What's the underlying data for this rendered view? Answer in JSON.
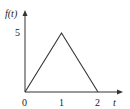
{
  "chart_data": {
    "type": "line",
    "title": "",
    "xlabel": "t",
    "ylabel": "f(t)",
    "x": [
      0,
      1,
      2
    ],
    "series": [
      {
        "name": "f(t)",
        "values": [
          0,
          5,
          0
        ]
      }
    ],
    "x_ticks": [
      "0",
      "1",
      "2"
    ],
    "y_ticks": [
      "5"
    ],
    "xlim": [
      0,
      2.6
    ],
    "ylim": [
      0,
      6.2
    ],
    "grid": false,
    "legend": "none",
    "line_color": "#333333"
  },
  "labels": {
    "ylabel": "f(t)",
    "xlabel": "t",
    "x0": "0",
    "x1": "1",
    "x2": "2",
    "y5": "5"
  }
}
